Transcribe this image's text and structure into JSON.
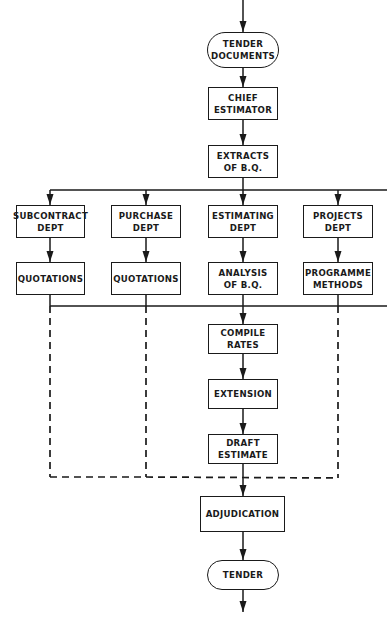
{
  "diagram": {
    "colors": {
      "line": "#1a1a1a",
      "background": "#ffffff"
    },
    "nodes": [
      {
        "id": "tender_documents",
        "shape": "terminal",
        "lines": [
          "TENDER",
          "DOCUMENTS"
        ],
        "x": 207,
        "y": 32,
        "w": 72,
        "h": 36
      },
      {
        "id": "chief_estimator",
        "shape": "box",
        "lines": [
          "CHIEF",
          "ESTIMATOR"
        ],
        "x": 208,
        "y": 87,
        "w": 70,
        "h": 33
      },
      {
        "id": "extracts_bq",
        "shape": "box",
        "lines": [
          "EXTRACTS",
          "OF B.Q."
        ],
        "x": 208,
        "y": 145,
        "w": 70,
        "h": 33
      },
      {
        "id": "subcontract_dept",
        "shape": "box",
        "lines": [
          "SUBCONTRACT",
          "DEPT"
        ],
        "x": 16,
        "y": 205,
        "w": 69,
        "h": 33
      },
      {
        "id": "purchase_dept",
        "shape": "box",
        "lines": [
          "PURCHASE",
          "DEPT"
        ],
        "x": 111,
        "y": 205,
        "w": 70,
        "h": 33
      },
      {
        "id": "estimating_dept",
        "shape": "box",
        "lines": [
          "ESTIMATING",
          "DEPT"
        ],
        "x": 208,
        "y": 205,
        "w": 70,
        "h": 33
      },
      {
        "id": "projects_dept",
        "shape": "box",
        "lines": [
          "PROJECTS",
          "DEPT"
        ],
        "x": 303,
        "y": 205,
        "w": 70,
        "h": 33
      },
      {
        "id": "quotations_sub",
        "shape": "box",
        "lines": [
          "QUOTATIONS"
        ],
        "x": 16,
        "y": 262,
        "w": 69,
        "h": 33
      },
      {
        "id": "quotations_pur",
        "shape": "box",
        "lines": [
          "QUOTATIONS"
        ],
        "x": 111,
        "y": 262,
        "w": 70,
        "h": 33
      },
      {
        "id": "analysis_bq",
        "shape": "box",
        "lines": [
          "ANALYSIS",
          "OF B.Q."
        ],
        "x": 208,
        "y": 262,
        "w": 70,
        "h": 33
      },
      {
        "id": "programme_methods",
        "shape": "box",
        "lines": [
          "PROGRAMME",
          "METHODS"
        ],
        "x": 303,
        "y": 262,
        "w": 70,
        "h": 33
      },
      {
        "id": "compile_rates",
        "shape": "box",
        "lines": [
          "COMPILE",
          "RATES"
        ],
        "x": 208,
        "y": 324,
        "w": 70,
        "h": 30
      },
      {
        "id": "extension",
        "shape": "box",
        "lines": [
          "EXTENSION"
        ],
        "x": 208,
        "y": 379,
        "w": 70,
        "h": 30
      },
      {
        "id": "draft_estimate",
        "shape": "box",
        "lines": [
          "DRAFT",
          "ESTIMATE"
        ],
        "x": 208,
        "y": 434,
        "w": 70,
        "h": 30
      },
      {
        "id": "adjudication",
        "shape": "box",
        "lines": [
          "ADJUDICATION"
        ],
        "x": 200,
        "y": 496,
        "w": 85,
        "h": 36
      },
      {
        "id": "tender",
        "shape": "terminal",
        "lines": [
          "TENDER"
        ],
        "x": 207,
        "y": 560,
        "w": 72,
        "h": 30
      }
    ],
    "solid_lines": [
      [
        [
          243,
          0
        ],
        [
          243,
          32
        ]
      ],
      [
        [
          243,
          68
        ],
        [
          243,
          87
        ]
      ],
      [
        [
          243,
          120
        ],
        [
          243,
          145
        ]
      ],
      [
        [
          243,
          178
        ],
        [
          243,
          205
        ]
      ],
      [
        [
          50,
          190
        ],
        [
          387,
          190
        ]
      ],
      [
        [
          50,
          190
        ],
        [
          50,
          205
        ]
      ],
      [
        [
          146,
          190
        ],
        [
          146,
          205
        ]
      ],
      [
        [
          338,
          190
        ],
        [
          338,
          205
        ]
      ],
      [
        [
          50,
          238
        ],
        [
          50,
          262
        ]
      ],
      [
        [
          146,
          238
        ],
        [
          146,
          262
        ]
      ],
      [
        [
          243,
          238
        ],
        [
          243,
          262
        ]
      ],
      [
        [
          338,
          238
        ],
        [
          338,
          262
        ]
      ],
      [
        [
          50,
          295
        ],
        [
          50,
          306
        ]
      ],
      [
        [
          146,
          295
        ],
        [
          146,
          306
        ]
      ],
      [
        [
          243,
          295
        ],
        [
          243,
          324
        ]
      ],
      [
        [
          338,
          295
        ],
        [
          338,
          306
        ]
      ],
      [
        [
          50,
          306
        ],
        [
          387,
          306
        ]
      ],
      [
        [
          243,
          354
        ],
        [
          243,
          379
        ]
      ],
      [
        [
          243,
          409
        ],
        [
          243,
          434
        ]
      ],
      [
        [
          243,
          464
        ],
        [
          243,
          496
        ]
      ],
      [
        [
          243,
          532
        ],
        [
          243,
          560
        ]
      ],
      [
        [
          243,
          590
        ],
        [
          243,
          612
        ]
      ]
    ],
    "dashed_lines": [
      [
        [
          50,
          306
        ],
        [
          50,
          477
        ]
      ],
      [
        [
          146,
          306
        ],
        [
          146,
          477
        ]
      ],
      [
        [
          338,
          306
        ],
        [
          338,
          478
        ]
      ],
      [
        [
          50,
          477
        ],
        [
          146,
          477
        ]
      ],
      [
        [
          146,
          477
        ],
        [
          338,
          478
        ]
      ]
    ],
    "arrowheads": [
      [
        243,
        32
      ],
      [
        243,
        87
      ],
      [
        243,
        145
      ],
      [
        243,
        205
      ],
      [
        50,
        205
      ],
      [
        146,
        205
      ],
      [
        338,
        205
      ],
      [
        50,
        262
      ],
      [
        146,
        262
      ],
      [
        243,
        262
      ],
      [
        338,
        262
      ],
      [
        243,
        324
      ],
      [
        243,
        379
      ],
      [
        243,
        434
      ],
      [
        243,
        496
      ],
      [
        243,
        560
      ],
      [
        243,
        612
      ]
    ]
  }
}
